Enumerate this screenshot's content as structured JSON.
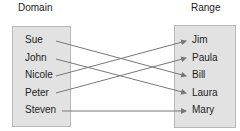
{
  "domain": {
    "title": "Domain",
    "items": [
      "Sue",
      "John",
      "Nicole",
      "Peter",
      "Steven"
    ]
  },
  "range": {
    "title": "Range",
    "items": [
      "Jim",
      "Paula",
      "Bill",
      "Laura",
      "Mary"
    ]
  },
  "mappings": [
    {
      "from": "Sue",
      "to": "Bill"
    },
    {
      "from": "John",
      "to": "Laura"
    },
    {
      "from": "Nicole",
      "to": "Jim"
    },
    {
      "from": "Peter",
      "to": "Paula"
    },
    {
      "from": "Steven",
      "to": "Mary"
    }
  ],
  "colors": {
    "box_fill": "#e2e2e2",
    "arrow": "#777777"
  }
}
